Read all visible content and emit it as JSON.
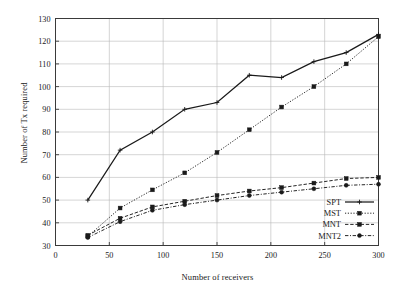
{
  "chart_data": {
    "type": "line",
    "title": "",
    "xlabel": "Number of receivers",
    "ylabel": "Number of Tx required",
    "xlim": [
      0,
      300
    ],
    "ylim": [
      30,
      130
    ],
    "xticks": [
      0,
      50,
      100,
      150,
      200,
      250,
      300
    ],
    "yticks": [
      30,
      40,
      50,
      60,
      70,
      80,
      90,
      100,
      110,
      120,
      130
    ],
    "grid": true,
    "legend_position": "lower right",
    "x": [
      30,
      60,
      90,
      120,
      150,
      180,
      210,
      240,
      270,
      300
    ],
    "series": [
      {
        "name": "SPT",
        "marker": "plus",
        "linestyle": "solid",
        "color": "#1a1a1a",
        "values": [
          50,
          72,
          80,
          90,
          93,
          105,
          104,
          111,
          115,
          123
        ]
      },
      {
        "name": "MST",
        "marker": "square",
        "linestyle": "dotted",
        "color": "#1a1a1a",
        "values": [
          34,
          46.5,
          54.5,
          62,
          71,
          81,
          91,
          100,
          110,
          122
        ]
      },
      {
        "name": "MNT",
        "marker": "square",
        "linestyle": "dashed",
        "color": "#1a1a1a",
        "values": [
          34.5,
          42,
          47,
          49.5,
          52,
          54,
          55.5,
          57.5,
          59.5,
          60
        ]
      },
      {
        "name": "MNT2",
        "marker": "circle",
        "linestyle": "dashdot",
        "color": "#1a1a1a",
        "values": [
          33.5,
          40.5,
          45.5,
          48,
          50,
          52,
          53.5,
          55,
          56.5,
          57
        ]
      }
    ]
  },
  "legend": {
    "entries": [
      {
        "label": "SPT"
      },
      {
        "label": "MST"
      },
      {
        "label": "MNT"
      },
      {
        "label": "MNT2"
      }
    ]
  },
  "xtick_labels": [
    "0",
    "50",
    "100",
    "150",
    "200",
    "250",
    "300"
  ],
  "ytick_labels": [
    "30",
    "40",
    "50",
    "60",
    "70",
    "80",
    "90",
    "100",
    "110",
    "120",
    "130"
  ],
  "colors": {
    "axis": "#3a3a3a",
    "grid": "#b9b9b9",
    "line": "#1a1a1a",
    "background": "#ffffff"
  }
}
